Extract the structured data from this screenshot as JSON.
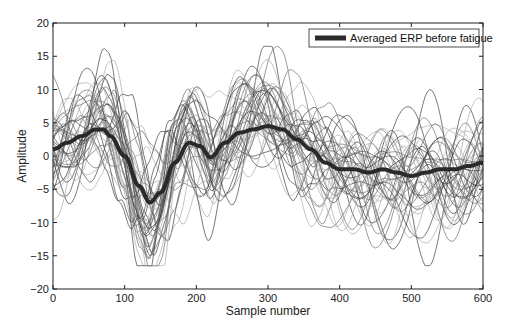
{
  "chart_data": {
    "type": "line",
    "title": "",
    "xlabel": "Sample number",
    "ylabel": "Amplitude",
    "xlim": [
      0,
      600
    ],
    "ylim": [
      -20,
      20
    ],
    "xticks": [
      0,
      100,
      200,
      300,
      400,
      500,
      600
    ],
    "yticks": [
      -20,
      -15,
      -10,
      -5,
      0,
      5,
      10,
      15,
      20
    ],
    "grid": false,
    "legend": {
      "position": "upper right",
      "entries": [
        "Averaged ERP before fatigue"
      ]
    },
    "series": [
      {
        "name": "Averaged ERP before fatigue",
        "style": "thick dark line",
        "x": [
          0,
          20,
          40,
          60,
          70,
          80,
          100,
          120,
          135,
          150,
          170,
          190,
          205,
          220,
          240,
          260,
          280,
          300,
          320,
          340,
          360,
          380,
          400,
          420,
          440,
          460,
          480,
          500,
          520,
          540,
          560,
          580,
          600
        ],
        "values": [
          1,
          2,
          3,
          4,
          4,
          3,
          0,
          -4.5,
          -7,
          -5.5,
          -1,
          2,
          1.5,
          -0.2,
          2,
          3.5,
          4,
          4.5,
          4,
          2.5,
          1,
          -1,
          -2,
          -2,
          -2.5,
          -2,
          -2.5,
          -3,
          -2.5,
          -2,
          -2,
          -1.5,
          -1
        ]
      },
      {
        "name": "Individual trials (thin gray lines)",
        "count": 40,
        "approx_range": [
          -16,
          16
        ],
        "note": "Single-trial ERPs overlaid around the average; peak trial reaches ~16 near sample 65, lowest ~-16 near sample 140"
      }
    ]
  },
  "colors": {
    "trial_dark": "#3a3a3a",
    "trial_mid": "#6a6a6a",
    "trial_light": "#a8a8a8",
    "average": "#2a2a2a",
    "axis": "#222222"
  }
}
